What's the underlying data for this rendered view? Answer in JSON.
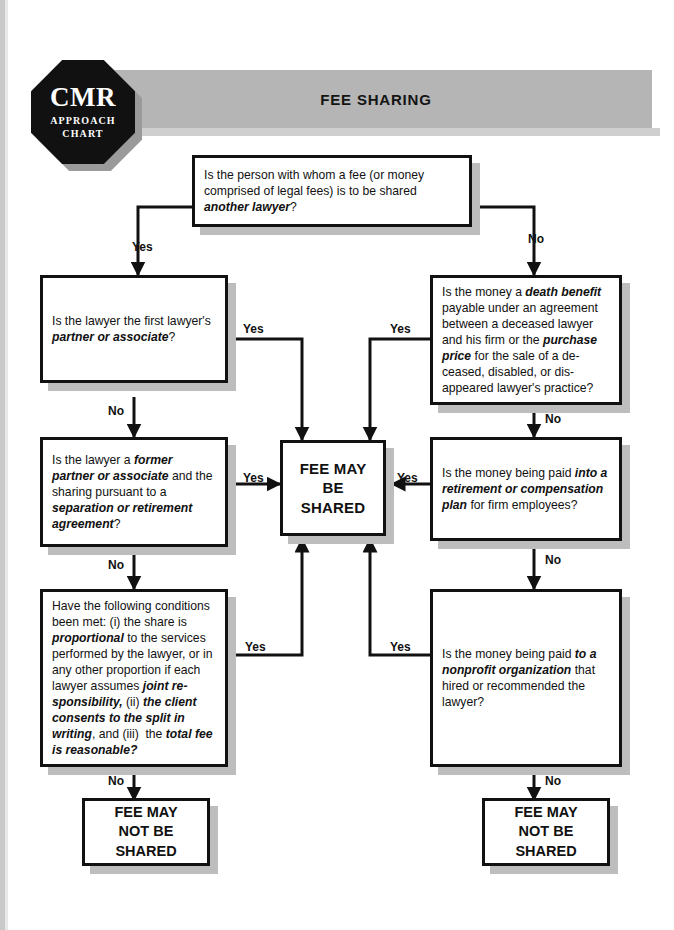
{
  "document": {
    "title": "FEE SHARING",
    "logo": {
      "main": "CMR",
      "line1": "APPROACH",
      "line2": "CHART"
    },
    "colors": {
      "header_bar": "#b5b5b5",
      "logo_fill": "#111111",
      "box_border": "#111111",
      "shadow": "#bdbdbd",
      "page": "#ffffff"
    }
  },
  "nodes": {
    "q_another_lawyer": {
      "id": "q-another-lawyer",
      "text_plain": "Is the person with whom a fee (or money comprised of legal fees) is to be shared another lawyer?",
      "html": "Is the person with whom a fee (or money comprised of legal fees) is to be shared <b>another lawyer</b>?"
    },
    "q_partner_associate": {
      "id": "q-partner-or-associate",
      "text_plain": "Is the lawyer the first lawyer's partner or associate?",
      "html": "Is the lawyer the first lawyer's <b>partner or associate</b>?"
    },
    "q_former_partner": {
      "id": "q-former-partner-separation",
      "text_plain": "Is the lawyer a former partner or associate and the sharing pursuant to a separation or retirement agreement?",
      "html": "Is the lawyer a <b>former partner or associate</b> and the sharing pursuant to a <b>separation or retirement agreement</b>?"
    },
    "q_conditions": {
      "id": "q-three-conditions",
      "text_plain": "Have the following conditions been met: (i) the share is proportional to the services performed by the lawyer, or in any other proportion if each lawyer assumes joint responsibility, (ii) the client consents to the split in writing, and (iii) the total fee is reasonable?",
      "html": "Have the following conditions been met: (i) the share is <b>proportional</b> to the services performed by the lawyer, or in any other proportion if each lawyer assumes <b>joint re-sponsibility,</b> (ii) <b>the client consents to the split in writing</b>, and (iii)&nbsp; the <b>total fee is reasonable?</b>"
    },
    "q_death_benefit": {
      "id": "q-death-benefit-purchase-price",
      "text_plain": "Is the money a death benefit payable under an agreement between a deceased lawyer and his firm or the purchase price for the sale of a deceased, disabled, or disappeared lawyer's practice?",
      "html": "Is the money a <b>death benefit</b> payable under an agreement between a deceased lawyer and his firm or the <b>purchase price</b> for the sale of a de-ceased, disabled, or dis-appeared lawyer's practice?"
    },
    "q_retirement_plan": {
      "id": "q-retirement-compensation-plan",
      "text_plain": "Is the money being paid into a retirement or compensation plan for firm employees?",
      "html": "Is the money being paid <b>into a retirement or compensation plan</b> for firm employees?"
    },
    "q_nonprofit": {
      "id": "q-nonprofit-organization",
      "text_plain": "Is the money being paid to a nonprofit organization that hired or recommended the lawyer?",
      "html": "Is the money being paid <b>to a nonprofit organization</b> that hired or recommended the lawyer?"
    },
    "r_may_be_shared": {
      "id": "result-fee-may-be-shared",
      "text_plain": "FEE MAY BE SHARED",
      "lines": [
        "FEE MAY",
        "BE",
        "SHARED"
      ]
    },
    "r_not_shared_left": {
      "id": "result-fee-may-not-be-shared-left",
      "text_plain": "FEE MAY NOT BE SHARED",
      "lines": [
        "FEE MAY",
        "NOT BE",
        "SHARED"
      ]
    },
    "r_not_shared_right": {
      "id": "result-fee-may-not-be-shared-right",
      "text_plain": "FEE MAY NOT BE SHARED",
      "lines": [
        "FEE MAY",
        "NOT BE",
        "SHARED"
      ]
    }
  },
  "edge_labels": {
    "root_yes": "Yes",
    "root_no": "No",
    "partner_yes": "Yes",
    "partner_no": "No",
    "former_yes": "Yes",
    "former_no": "No",
    "conditions_yes": "Yes",
    "conditions_no": "No",
    "death_yes": "Yes",
    "death_no": "No",
    "retirement_yes": "Yes",
    "retirement_no": "No",
    "nonprofit_yes": "Yes",
    "nonprofit_no": "No"
  },
  "chart_data": {
    "type": "diagram",
    "title": "FEE SHARING",
    "diagram_kind": "decision-flowchart",
    "flow": [
      {
        "from": "q_another_lawyer",
        "label": "Yes",
        "to": "q_partner_associate"
      },
      {
        "from": "q_another_lawyer",
        "label": "No",
        "to": "q_death_benefit"
      },
      {
        "from": "q_partner_associate",
        "label": "Yes",
        "to": "r_may_be_shared"
      },
      {
        "from": "q_partner_associate",
        "label": "No",
        "to": "q_former_partner"
      },
      {
        "from": "q_former_partner",
        "label": "Yes",
        "to": "r_may_be_shared"
      },
      {
        "from": "q_former_partner",
        "label": "No",
        "to": "q_conditions"
      },
      {
        "from": "q_conditions",
        "label": "Yes",
        "to": "r_may_be_shared"
      },
      {
        "from": "q_conditions",
        "label": "No",
        "to": "r_not_shared_left"
      },
      {
        "from": "q_death_benefit",
        "label": "Yes",
        "to": "r_may_be_shared"
      },
      {
        "from": "q_death_benefit",
        "label": "No",
        "to": "q_retirement_plan"
      },
      {
        "from": "q_retirement_plan",
        "label": "Yes",
        "to": "r_may_be_shared"
      },
      {
        "from": "q_retirement_plan",
        "label": "No",
        "to": "q_nonprofit"
      },
      {
        "from": "q_nonprofit",
        "label": "Yes",
        "to": "r_may_be_shared"
      },
      {
        "from": "q_nonprofit",
        "label": "No",
        "to": "r_not_shared_right"
      }
    ]
  }
}
